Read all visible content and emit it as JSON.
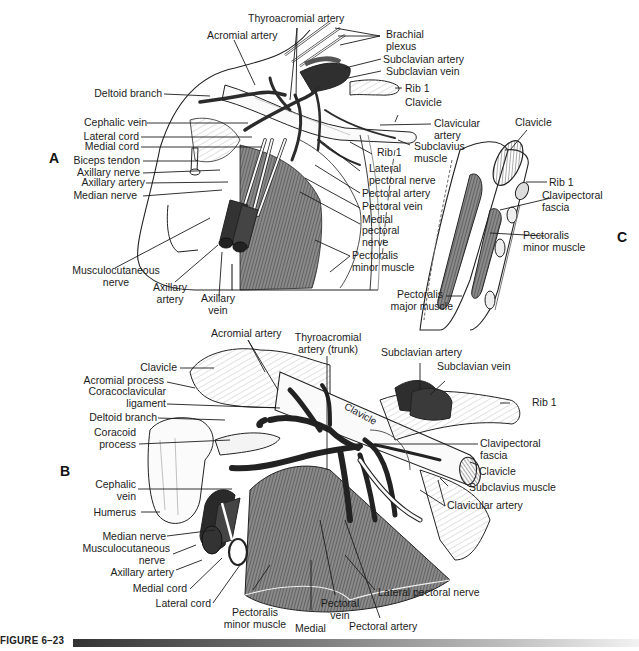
{
  "figure": {
    "caption": "FIGURE 6–23",
    "panels": {
      "A": {
        "letter": "A",
        "labels": {
          "thyroacromial_artery": "Thyroacromial artery",
          "acromial_artery": "Acromial artery",
          "brachial_plexus_1": "Brachial",
          "brachial_plexus_2": "plexus",
          "subclavian_artery": "Subclavian artery",
          "subclavian_vein": "Subclavian vein",
          "rib1_top": "Rib 1",
          "clavicle": "Clavicle",
          "clavicular_artery_1": "Clavicular",
          "clavicular_artery_2": "artery",
          "subclavius_muscle_1": "Subclavius",
          "subclavius_muscle_2": "muscle",
          "rib1_mid": "Rib 1",
          "deltoid_branch": "Deltoid branch",
          "cephalic_vein": "Cephalic vein",
          "lateral_cord": "Lateral cord",
          "medial_cord": "Medial cord",
          "biceps_tendon": "Biceps tendon",
          "axillary_nerve": "Axillary nerve",
          "axillary_artery_left": "Axillary artery",
          "median_nerve": "Median nerve",
          "lateral_pectoral_nerve_1": "Lateral",
          "lateral_pectoral_nerve_2": "pectoral nerve",
          "pectoral_artery": "Pectoral artery",
          "pectoral_vein": "Pectoral vein",
          "medial_pectoral_nerve_1": "Medial",
          "medial_pectoral_nerve_2": "pectoral",
          "medial_pectoral_nerve_3": "nerve",
          "pectoralis_minor_1": "Pectoralis",
          "pectoralis_minor_2": "minor muscle",
          "musculocutaneous_1": "Musculocutaneous",
          "musculocutaneous_2": "nerve",
          "axillary_artery_bottom_1": "Axillary",
          "axillary_artery_bottom_2": "artery",
          "axillary_vein_1": "Axillary",
          "axillary_vein_2": "vein"
        }
      },
      "B": {
        "letter": "B",
        "labels": {
          "acromial_artery": "Acromial artery",
          "thyroacromial_trunk_1": "Thyroacromial",
          "thyroacromial_trunk_2": "artery (trunk)",
          "subclavian_artery": "Subclavian artery",
          "subclavian_vein": "Subclavian vein",
          "rib1": "Rib 1",
          "clavicle_left": "Clavicle",
          "acromial_process": "Acromial process",
          "coracoclavicular_1": "Coracoclavicular",
          "coracoclavicular_2": "ligament",
          "deltoid_branch": "Deltoid branch",
          "coracoid_1": "Coracoid",
          "coracoid_2": "process",
          "clavicle_on_bone": "Clavicle",
          "clavipectoral_1": "Clavipectoral",
          "clavipectoral_2": "fascia",
          "clavicle_right": "Clavicle",
          "subclavius_muscle": "Subclavius muscle",
          "clavicular_artery": "Clavicular artery",
          "cephalic_vein_1": "Cephalic",
          "cephalic_vein_2": "vein",
          "humerus": "Humerus",
          "median_nerve": "Median nerve",
          "musculocutaneous_1": "Musculocutaneous",
          "musculocutaneous_2": "nerve",
          "axillary_artery": "Axillary artery",
          "medial_cord": "Medial cord",
          "lateral_cord": "Lateral cord",
          "pectoralis_minor_1": "Pectoralis",
          "pectoralis_minor_2": "minor muscle",
          "medial": "Medial",
          "pectoral_vein_1": "Pectoral",
          "pectoral_vein_2": "vein",
          "pectoral_artery": "Pectoral artery",
          "lateral_pectoral_nerve": "Lateral pectoral nerve"
        }
      },
      "C": {
        "letter": "C",
        "labels": {
          "clavicle": "Clavicle",
          "rib1": "Rib 1",
          "clavipectoral_1": "Clavipectoral",
          "clavipectoral_2": "fascia",
          "pectoralis_minor_1": "Pectoralis",
          "pectoralis_minor_2": "minor muscle",
          "pectoralis_major_1": "Pectoralis",
          "pectoralis_major_2": "major muscle"
        }
      }
    }
  }
}
